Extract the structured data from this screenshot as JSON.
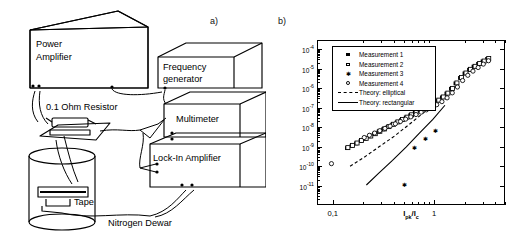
{
  "figure": {
    "panel_a_label": "a)",
    "panel_b_label": "b)"
  },
  "schematic": {
    "title": "AC loss measurement setup",
    "boxes": [
      {
        "name": "power-amplifier",
        "lines": [
          "Power",
          "Amplifier"
        ]
      },
      {
        "name": "frequency-generator",
        "lines": [
          "Frequency",
          "generator"
        ]
      },
      {
        "name": "multimeter",
        "lines": [
          "Multimeter"
        ]
      },
      {
        "name": "lock-in-amplifier",
        "lines": [
          "Lock-In Amplifier"
        ]
      }
    ],
    "labels": [
      {
        "name": "resistor-label",
        "text": "0.1 Ohm Resistor"
      },
      {
        "name": "tape-label",
        "text": "Tape"
      },
      {
        "name": "nitrogen-dewar-label",
        "text": "Nitrogen Dewar"
      }
    ]
  },
  "chart_data": {
    "type": "scatter",
    "title": "",
    "xlabel": "Iₚₖ/Iᴄ",
    "xlabel_parts": {
      "main": "I",
      "sub": "pk",
      "denom_main": "I",
      "denom_sub": "c"
    },
    "ylabel": "Normalised ac loss per cycle ( Q / Iᴄ² )",
    "xscale": "log",
    "yscale": "log",
    "xlim": [
      0.07,
      5.0
    ],
    "ylim": [
      1e-12,
      0.0003
    ],
    "grid": false,
    "legend_position": "upper-left",
    "xticks": [
      {
        "value": 0.1,
        "label": "0,1"
      },
      {
        "value": 1.0,
        "label": "1"
      }
    ],
    "yticks": [
      {
        "value": 0.0001,
        "mantissa": "10",
        "exponent": "-4"
      },
      {
        "value": 1e-05,
        "mantissa": "10",
        "exponent": "-5"
      },
      {
        "value": 1e-06,
        "mantissa": "10",
        "exponent": "-6"
      },
      {
        "value": 1e-07,
        "mantissa": "10",
        "exponent": "-7"
      },
      {
        "value": 1e-08,
        "mantissa": "10",
        "exponent": "-8"
      },
      {
        "value": 1e-09,
        "mantissa": "10",
        "exponent": "-9"
      },
      {
        "value": 1e-10,
        "mantissa": "10",
        "exponent": "-10"
      },
      {
        "value": 1e-11,
        "mantissa": "10",
        "exponent": "-11"
      }
    ],
    "legend": [
      {
        "name": "measurement-1",
        "label": "Measurement 1",
        "marker": "filled-square"
      },
      {
        "name": "measurement-2",
        "label": "Measurement 2",
        "marker": "open-square"
      },
      {
        "name": "measurement-3",
        "label": "Measurement 3",
        "marker": "star"
      },
      {
        "name": "measurement-4",
        "label": "Measurement 4",
        "marker": "open-circle"
      },
      {
        "name": "theory-elliptical",
        "label": "Theory: elliptical",
        "marker": "dashed-line"
      },
      {
        "name": "theory-rectangular",
        "label": "Theory: rectangular",
        "marker": "solid-line"
      }
    ],
    "series": [
      {
        "name": "Measurement 1",
        "marker": "filled-square",
        "x": [
          0.135,
          0.15,
          0.166,
          0.184,
          0.204,
          0.226,
          0.25,
          0.277,
          0.307,
          0.34,
          0.377,
          0.418,
          0.463,
          0.513,
          0.568,
          0.63,
          0.698,
          0.773,
          0.857,
          0.95,
          1.052,
          1.166,
          1.292,
          1.432,
          1.587,
          1.758,
          1.948,
          2.159,
          2.392,
          2.651,
          2.937,
          3.255
        ],
        "y": [
          9.5e-10,
          1.25e-09,
          1.65e-09,
          2.2e-09,
          2.9e-09,
          3.8e-09,
          5e-09,
          6.6e-09,
          8.7e-09,
          1.15e-08,
          1.52e-08,
          2e-08,
          2.65e-08,
          3.5e-08,
          4.6e-08,
          6.1e-08,
          8.1e-08,
          1.07e-07,
          1.42e-07,
          1.9e-07,
          2.6e-07,
          3.8e-07,
          6e-07,
          1.05e-06,
          2e-06,
          3.8e-06,
          6.5e-06,
          1e-05,
          1.45e-05,
          2e-05,
          2.7e-05,
          3.6e-05
        ]
      },
      {
        "name": "Measurement 2",
        "marker": "open-square",
        "x": [
          0.138,
          0.153,
          0.17,
          0.188,
          0.209,
          0.232,
          0.257,
          0.285,
          0.316,
          0.35,
          0.388,
          0.43,
          0.477,
          0.529,
          0.586,
          0.65,
          0.72,
          0.798,
          0.885,
          0.981,
          1.087,
          1.205,
          1.336,
          1.481,
          1.642,
          1.82,
          2.017,
          2.236,
          2.479,
          2.748,
          3.046,
          3.377
        ],
        "y": [
          1e-09,
          1.3e-09,
          1.72e-09,
          2.3e-09,
          3e-09,
          3.95e-09,
          5.2e-09,
          6.9e-09,
          9.1e-09,
          1.2e-08,
          1.58e-08,
          2.1e-08,
          2.78e-08,
          3.67e-08,
          4.85e-08,
          6.4e-08,
          8.5e-08,
          1.12e-07,
          1.49e-07,
          2e-07,
          2.75e-07,
          4e-07,
          6.3e-07,
          1.1e-06,
          2.1e-06,
          4e-06,
          6.8e-06,
          1.05e-05,
          1.5e-05,
          2.1e-05,
          2.8e-05,
          3.8e-05
        ]
      },
      {
        "name": "Measurement 3",
        "marker": "star",
        "x": [
          0.5,
          0.63,
          0.8,
          1.0
        ],
        "y": [
          1.3e-11,
          1e-09,
          3e-09,
          7e-09
        ]
      },
      {
        "name": "Measurement 4",
        "marker": "open-circle",
        "x": [
          0.095,
          0.2,
          0.225,
          0.253,
          0.285,
          0.32,
          0.36,
          0.405,
          0.455,
          0.512,
          0.576,
          0.648,
          0.729,
          0.82,
          0.922,
          1.037,
          1.167,
          1.312,
          1.476,
          1.66,
          1.867,
          2.1,
          2.362,
          2.657,
          2.988,
          3.361
        ],
        "y": [
          1.5e-10,
          3.3e-09,
          4.3e-09,
          5.6e-09,
          7.4e-09,
          9.7e-09,
          1.27e-08,
          1.67e-08,
          2.2e-08,
          2.9e-08,
          3.8e-08,
          5e-08,
          6.6e-08,
          8.7e-08,
          1.15e-07,
          1.6e-07,
          2.3e-07,
          3.6e-07,
          6.5e-07,
          1.3e-06,
          2.8e-06,
          5.2e-06,
          8.5e-06,
          1.3e-05,
          1.95e-05,
          2.9e-05
        ]
      }
    ],
    "theory_curves": [
      {
        "name": "Theory: elliptical",
        "style": "dashed",
        "x": [
          0.145,
          0.2,
          0.28,
          0.4,
          0.55,
          0.75,
          1.0
        ],
        "y": [
          1.1e-10,
          3.2e-10,
          1.1e-09,
          4e-09,
          1.5e-08,
          5.5e-08,
          2e-07
        ]
      },
      {
        "name": "Theory: rectangular",
        "style": "solid",
        "x": [
          0.21,
          0.28,
          0.38,
          0.52,
          0.7,
          0.95,
          1.25
        ],
        "y": [
          1.2e-11,
          5e-11,
          2.2e-10,
          1.1e-09,
          5.5e-09,
          2.8e-08,
          1.5e-07
        ]
      }
    ]
  }
}
